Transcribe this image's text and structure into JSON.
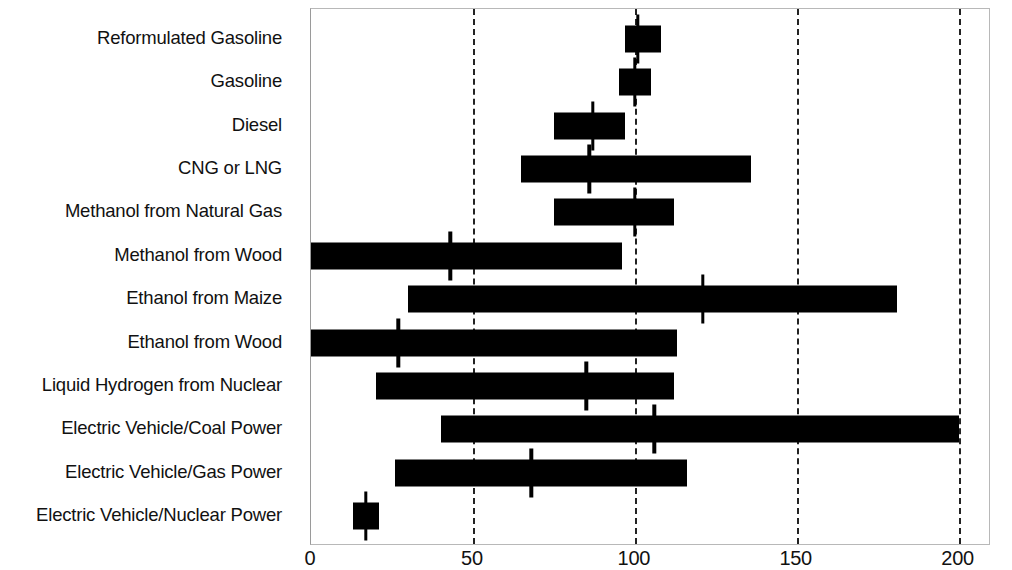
{
  "chart_data": {
    "type": "bar",
    "title": "",
    "subtitle": "",
    "xlabel": "",
    "ylabel": "",
    "xlim": [
      0,
      210
    ],
    "ylim": null,
    "grid": "vertical dashed gridlines at 0, 50, 100, 150, 200",
    "legend": "none",
    "orientation": "horizontal",
    "xticks": [
      0,
      50,
      100,
      150,
      200
    ],
    "xtick_labels": [
      "0",
      "50",
      "100",
      "150",
      "200"
    ],
    "categories": [
      "Reformulated Gasoline",
      "Gasoline",
      "Diesel",
      "CNG or LNG",
      "Methanol from Natural Gas",
      "Methanol from Wood",
      "Ethanol from Maize",
      "Ethanol from Wood",
      "Liquid Hydrogen from Nuclear",
      "Electric Vehicle/Coal  Power",
      "Electric Vehicle/Gas Power",
      "Electric Vehicle/Nuclear Power"
    ],
    "series": [
      {
        "name": "range_low",
        "values": [
          97,
          95,
          75,
          65,
          75,
          0,
          30,
          0,
          20,
          40,
          26,
          13
        ]
      },
      {
        "name": "range_high",
        "values": [
          108,
          105,
          97,
          136,
          112,
          96,
          181,
          113,
          112,
          200,
          116,
          21
        ]
      },
      {
        "name": "marker",
        "values": [
          101,
          100,
          87,
          86,
          100,
          43,
          121,
          27,
          85,
          106,
          68,
          17
        ]
      }
    ],
    "bars": [
      {
        "category": "Reformulated Gasoline",
        "low": 97,
        "high": 108,
        "marker": 101
      },
      {
        "category": "Gasoline",
        "low": 95,
        "high": 105,
        "marker": 100
      },
      {
        "category": "Diesel",
        "low": 75,
        "high": 97,
        "marker": 87
      },
      {
        "category": "CNG or LNG",
        "low": 65,
        "high": 136,
        "marker": 86
      },
      {
        "category": "Methanol from Natural Gas",
        "low": 75,
        "high": 112,
        "marker": 100
      },
      {
        "category": "Methanol from Wood",
        "low": 0,
        "high": 96,
        "marker": 43
      },
      {
        "category": "Ethanol from Maize",
        "low": 30,
        "high": 181,
        "marker": 121
      },
      {
        "category": "Ethanol from Wood",
        "low": 0,
        "high": 113,
        "marker": 27
      },
      {
        "category": "Liquid Hydrogen from Nuclear",
        "low": 20,
        "high": 112,
        "marker": 85
      },
      {
        "category": "Electric Vehicle/Coal  Power",
        "low": 40,
        "high": 200,
        "marker": 106
      },
      {
        "category": "Electric Vehicle/Gas Power",
        "low": 26,
        "high": 116,
        "marker": 68
      },
      {
        "category": "Electric Vehicle/Nuclear Power",
        "low": 13,
        "high": 21,
        "marker": 17
      }
    ]
  }
}
